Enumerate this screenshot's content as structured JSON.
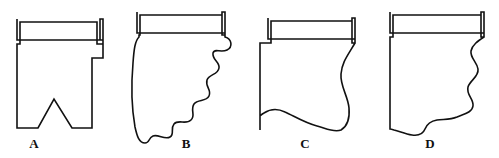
{
  "figure": {
    "type": "line-diagram",
    "title": "",
    "width": 499,
    "height": 158,
    "background_color": "#ffffff",
    "stroke_color": "#111111",
    "stroke_width": 1.6,
    "panels": [
      {
        "id": "A",
        "label": "A",
        "label_x": 34,
        "label_y": 136,
        "edge_style": "straight-with-step-and-triangular-notch",
        "path": "M 17 19 L 17 40 L 100 40 L 100 19 L 103 19 L 103 44 L 103 58 L 92 58 L 92 128 L 72 128 L 54 99 L 38 128 L 17 128 L 17 44 L 20 44 L 20 22 L 97 22 L 97 44 L 103 44 L 103 40 L 17 40 Z"
      },
      {
        "id": "B",
        "label": "B",
        "label_x": 186,
        "label_y": 136,
        "edge_style": "scalloped-diagonal",
        "path": "M 137 12 L 137 33 L 222 33 L 222 12 L 225 12 L 225 37 C 232 39 233 47 227 50 C 221 53 214 48 213 53 C 212 60 220 62 219 68 C 218 75 209 74 207 80 C 205 87 212 90 209 96 C 206 102 198 99 194 104 C 190 110 196 116 191 120 C 186 125 178 119 174 124 C 170 129 175 134 170 137 C 165 140 158 134 153 136 C 148 138 150 143 145 143 C 139 143 137 136 135 127 C 132 110 131 86 133 63 C 134 49 135 41 139 37 L 139 35 L 140 35 L 140 15 L 222 15 L 222 35 L 225 35 L 225 33 L 137 33 Z"
      },
      {
        "id": "C",
        "label": "C",
        "label_x": 305,
        "label_y": 136,
        "edge_style": "gentle-s-curve-and-wavy-base",
        "path": "M 268 18 L 268 39 L 352 39 L 352 18 L 355 18 L 355 43 C 348 55 342 62 341 74 C 340 86 348 96 349 108 C 350 120 346 127 341 130 C 334 133 325 128 317 126 C 305 123 294 116 285 112 C 277 108 270 109 264 113 C 262 114 261 115 260 116 L 260 130 L 260 130 L 260 130 L 260 43 L 271 43 L 271 21 L 352 21 L 352 43 L 355 43 L 355 39 L 268 39 Z"
      },
      {
        "id": "D",
        "label": "D",
        "label_x": 430,
        "label_y": 136,
        "edge_style": "irregular-stepped-profile",
        "path": "M 390 12 L 390 33 L 481 33 L 481 12 L 484 12 L 484 37 C 478 41 472 45 471 51 C 470 58 477 62 478 69 C 479 77 470 80 468 87 C 466 95 474 99 473 106 C 472 113 463 114 457 117 C 450 120 443 119 437 120 C 431 121 427 124 425 129 C 423 134 419 136 412 135 C 405 134 399 131 394 130 C 391 129 390 129 390 129 L 390 113 L 390 37 L 393 37 L 393 15 L 481 15 L 481 37 L 484 37 L 484 33 L 390 33 Z"
      }
    ]
  }
}
